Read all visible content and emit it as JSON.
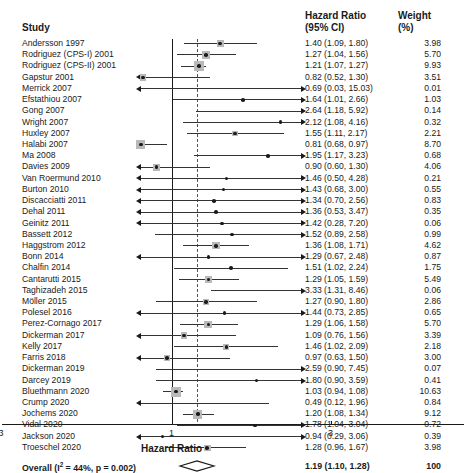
{
  "headers": {
    "study": "Study",
    "hazard_ratio_line1": "Hazard Ratio",
    "hazard_ratio_line2": "(95% CI)",
    "weight_line1": "Weight",
    "weight_line2": "(%)"
  },
  "axis": {
    "title": "Hazard Ratio",
    "ticks": [
      "0.3",
      "1",
      "3"
    ],
    "tick_values": [
      0.3,
      1,
      3
    ],
    "reference_line": 1,
    "pooled_line": 1.19
  },
  "overall": {
    "label": "Overall (I² = 44%, p = 0.002)",
    "label_prefix": "Overall (I",
    "label_sup": "2",
    "label_suffix": " = 44%, p = 0.002)",
    "hr_text": "1.19 (1.10, 1.28)",
    "weight": "100",
    "estimate": 1.19,
    "lower": 1.1,
    "upper": 1.28,
    "heterogeneity_i2": "44%",
    "p_value": "0.002"
  },
  "chart_data": {
    "type": "forest",
    "title": "",
    "xlabel": "Hazard Ratio",
    "ylabel": "",
    "xscale": "log",
    "xlim": [
      0.25,
      3.6
    ],
    "xticks": [
      0.3,
      1,
      3
    ],
    "grid": false,
    "reference_line": 1,
    "pooled_estimate": 1.19,
    "pooled_ci": [
      1.1,
      1.28
    ],
    "pooled_weight": 100,
    "heterogeneity": "I2 = 44%, p = 0.002",
    "columns": [
      "Study",
      "Hazard Ratio (95% CI)",
      "Weight (%)"
    ],
    "rows": [
      {
        "study": "Andersson 1997",
        "hr": 1.4,
        "lo": 1.09,
        "hi": 1.8,
        "hr_text": "1.40 (1.09, 1.80)",
        "weight": "3.98",
        "w": 3.98
      },
      {
        "study": "Rodriguez (CPS-I) 2001",
        "hr": 1.27,
        "lo": 1.04,
        "hi": 1.56,
        "hr_text": "1.27 (1.04, 1.56)",
        "weight": "5.70",
        "w": 5.7
      },
      {
        "study": "Rodriguez (CPS-II) 2001",
        "hr": 1.21,
        "lo": 1.07,
        "hi": 1.27,
        "hr_text": "1.21 (1.07, 1.27)",
        "weight": "9.93",
        "w": 9.93
      },
      {
        "study": "Gapstur 2001",
        "hr": 0.82,
        "lo": 0.52,
        "hi": 1.3,
        "hr_text": "0.82 (0.52, 1.30)",
        "weight": "3.51",
        "w": 3.51
      },
      {
        "study": "Merrick 2007",
        "hr": 0.69,
        "lo": 0.03,
        "hi": 15.03,
        "hr_text": "0.69 (0.03, 15.03)",
        "weight": "0.01",
        "w": 0.01
      },
      {
        "study": "Efstathiou 2007",
        "hr": 1.64,
        "lo": 1.01,
        "hi": 2.66,
        "hr_text": "1.64 (1.01, 2.66)",
        "weight": "1.03",
        "w": 1.03
      },
      {
        "study": "Gong 2007",
        "hr": 2.64,
        "lo": 1.18,
        "hi": 5.92,
        "hr_text": "2.64 (1.18, 5.92)",
        "weight": "0.14",
        "w": 0.14
      },
      {
        "study": "Wright 2007",
        "hr": 2.12,
        "lo": 1.08,
        "hi": 4.16,
        "hr_text": "2.12 (1.08, 4.16)",
        "weight": "0.32",
        "w": 0.32
      },
      {
        "study": "Huxley 2007",
        "hr": 1.55,
        "lo": 1.11,
        "hi": 2.17,
        "hr_text": "1.55 (1.11, 2.17)",
        "weight": "2.21",
        "w": 2.21
      },
      {
        "study": "Halabi 2007",
        "hr": 0.81,
        "lo": 0.68,
        "hi": 0.97,
        "hr_text": "0.81 (0.68, 0.97)",
        "weight": "8.70",
        "w": 8.7
      },
      {
        "study": "Ma 2008",
        "hr": 1.95,
        "lo": 1.17,
        "hi": 3.23,
        "hr_text": "1.95 (1.17, 3.23)",
        "weight": "0.68",
        "w": 0.68
      },
      {
        "study": "Davies 2009",
        "hr": 0.9,
        "lo": 0.6,
        "hi": 1.3,
        "hr_text": "0.90 (0.60, 1.30)",
        "weight": "4.06",
        "w": 4.06
      },
      {
        "study": "Van Roermund 2010",
        "hr": 1.46,
        "lo": 0.5,
        "hi": 4.28,
        "hr_text": "1.46 (0.50, 4.28)",
        "weight": "0.21",
        "w": 0.21
      },
      {
        "study": "Burton 2010",
        "hr": 1.43,
        "lo": 0.68,
        "hi": 3.0,
        "hr_text": "1.43 (0.68, 3.00)",
        "weight": "0.55",
        "w": 0.55
      },
      {
        "study": "Discacciatti 2011",
        "hr": 1.34,
        "lo": 0.7,
        "hi": 2.56,
        "hr_text": "1.34 (0.70, 2.56)",
        "weight": "0.83",
        "w": 0.83
      },
      {
        "study": "Dehal 2011",
        "hr": 1.36,
        "lo": 0.53,
        "hi": 3.47,
        "hr_text": "1.36 (0.53, 3.47)",
        "weight": "0.35",
        "w": 0.35
      },
      {
        "study": "Geinitz 2011",
        "hr": 1.42,
        "lo": 0.28,
        "hi": 7.2,
        "hr_text": "1.42 (0.28, 7.20)",
        "weight": "0.06",
        "w": 0.06
      },
      {
        "study": "Bassett 2012",
        "hr": 1.52,
        "lo": 0.89,
        "hi": 2.58,
        "hr_text": "1.52 (0.89, 2.58)",
        "weight": "0.99",
        "w": 0.99
      },
      {
        "study": "Haggstrom 2012",
        "hr": 1.36,
        "lo": 1.08,
        "hi": 1.71,
        "hr_text": "1.36 (1.08, 1.71)",
        "weight": "4.62",
        "w": 4.62
      },
      {
        "study": "Bonn 2014",
        "hr": 1.29,
        "lo": 0.67,
        "hi": 2.48,
        "hr_text": "1.29 (0.67, 2.48)",
        "weight": "0.87",
        "w": 0.87
      },
      {
        "study": "Chalfin 2014",
        "hr": 1.51,
        "lo": 1.02,
        "hi": 2.24,
        "hr_text": "1.51 (1.02, 2.24)",
        "weight": "1.75",
        "w": 1.75
      },
      {
        "study": "Cantarutti 2015",
        "hr": 1.29,
        "lo": 1.05,
        "hi": 1.59,
        "hr_text": "1.29 (1.05, 1.59)",
        "weight": "5.49",
        "w": 5.49
      },
      {
        "study": "Taghizadeh 2015",
        "hr": 3.33,
        "lo": 1.31,
        "hi": 8.46,
        "hr_text": "3.33 (1.31, 8.46)",
        "weight": "0.06",
        "w": 0.06
      },
      {
        "study": "Möller 2015",
        "hr": 1.27,
        "lo": 0.9,
        "hi": 1.8,
        "hr_text": "1.27 (0.90, 1.80)",
        "weight": "2.86",
        "w": 2.86
      },
      {
        "study": "Polesel 2016",
        "hr": 1.44,
        "lo": 0.73,
        "hi": 2.85,
        "hr_text": "1.44 (0.73, 2.85)",
        "weight": "0.65",
        "w": 0.65
      },
      {
        "study": "Perez-Cornago 2017",
        "hr": 1.29,
        "lo": 1.06,
        "hi": 1.58,
        "hr_text": "1.29 (1.06, 1.58)",
        "weight": "5.70",
        "w": 5.7
      },
      {
        "study": "Dickerman 2017",
        "hr": 1.09,
        "lo": 0.76,
        "hi": 1.56,
        "hr_text": "1.09 (0.76, 1.56)",
        "weight": "3.39",
        "w": 3.39
      },
      {
        "study": "Kelly 2017",
        "hr": 1.46,
        "lo": 1.02,
        "hi": 2.09,
        "hr_text": "1.46 (1.02, 2.09)",
        "weight": "2.18",
        "w": 2.18
      },
      {
        "study": "Farris 2018",
        "hr": 0.97,
        "lo": 0.63,
        "hi": 1.5,
        "hr_text": "0.97 (0.63, 1.50)",
        "weight": "3.00",
        "w": 3.0
      },
      {
        "study": "Dickerman 2019",
        "hr": 2.59,
        "lo": 0.9,
        "hi": 7.45,
        "hr_text": "2.59 (0.90, 7.45)",
        "weight": "0.07",
        "w": 0.07
      },
      {
        "study": "Darcey 2019",
        "hr": 1.8,
        "lo": 0.9,
        "hi": 3.59,
        "hr_text": "1.80 (0.90, 3.59)",
        "weight": "0.41",
        "w": 0.41
      },
      {
        "study": "Bluethmann 2020",
        "hr": 1.03,
        "lo": 0.94,
        "hi": 1.08,
        "hr_text": "1.03 (0.94, 1.08)",
        "weight": "10.63",
        "w": 10.63
      },
      {
        "study": "Crump 2020",
        "hr": 0.49,
        "lo": 0.12,
        "hi": 1.96,
        "hr_text": "0.49 (0.12, 1.96)",
        "weight": "0.84",
        "w": 0.84
      },
      {
        "study": "Jochems 2020",
        "hr": 1.2,
        "lo": 1.08,
        "hi": 1.34,
        "hr_text": "1.20 (1.08, 1.34)",
        "weight": "9.12",
        "w": 9.12
      },
      {
        "study": "Vidal 2020",
        "hr": 1.78,
        "lo": 1.04,
        "hi": 3.04,
        "hr_text": "1.78 (1.04, 3.04)",
        "weight": "0.72",
        "w": 0.72
      },
      {
        "study": "Jackson 2020",
        "hr": 0.94,
        "lo": 0.29,
        "hi": 3.06,
        "hr_text": "0.94 (0.29, 3.06)",
        "weight": "0.39",
        "w": 0.39
      },
      {
        "study": "Troeschel 2020",
        "hr": 1.28,
        "lo": 0.96,
        "hi": 1.67,
        "hr_text": "1.28 (0.96, 1.67)",
        "weight": "3.98",
        "w": 3.98
      }
    ]
  },
  "colors": {
    "text": "#1a1a1a",
    "line": "#333333",
    "marker": "#1a1a1a",
    "marker_box": "#b9b9b9",
    "reference_line": "#1a1a1a",
    "pooled_line": "#555555"
  }
}
